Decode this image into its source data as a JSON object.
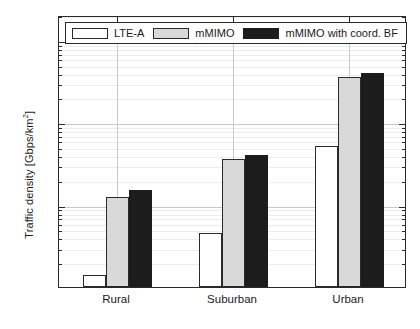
{
  "chart_data": {
    "type": "bar",
    "title": "",
    "xlabel": "",
    "ylabel": "Traffic density [Gbps/km²]",
    "ylabel_base": "Traffic density [Gbps/km",
    "ylabel_sup": "2",
    "ylabel_tail": "]",
    "categories": [
      "Rural",
      "Suburban",
      "Urban"
    ],
    "series": [
      {
        "name": "LTE-A",
        "values": [
          1.4,
          4.5,
          52
        ]
      },
      {
        "name": "mMIMO",
        "values": [
          12.5,
          36,
          350
        ]
      },
      {
        "name": "mMIMO with coord. BF",
        "values": [
          15,
          40,
          400
        ]
      }
    ],
    "yscale": "log",
    "ylim": [
      1,
      2000
    ],
    "ytick_values": [
      1,
      10,
      100,
      1000
    ],
    "ytick_labels": [
      {
        "mantissa": "10",
        "exponent": "0"
      },
      {
        "mantissa": "10",
        "exponent": "1"
      },
      {
        "mantissa": "10",
        "exponent": "2"
      },
      {
        "mantissa": "10",
        "exponent": "3"
      }
    ],
    "grid": true,
    "minor_grid": true,
    "legend_position": "top-left-inside",
    "colors": {
      "series_0": "#ffffff",
      "series_1": "#d9d9d9",
      "series_2": "#1c1c1c",
      "edge": "#2a2a2a",
      "grid_major": "#c9c9c9",
      "grid_minor": "#ececec",
      "background": "#ffffff"
    }
  },
  "legend": {
    "entries": [
      {
        "label": "LTE-A"
      },
      {
        "label": "mMIMO"
      },
      {
        "label": "mMIMO with coord. BF"
      }
    ]
  }
}
